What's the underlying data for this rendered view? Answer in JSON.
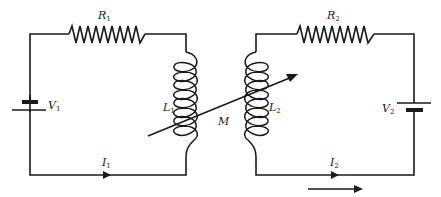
{
  "diagram": {
    "left_circuit": {
      "resistor": {
        "symbol": "R",
        "subscript": "1"
      },
      "inductor": {
        "symbol": "L",
        "subscript": "1"
      },
      "source": {
        "symbol": "V",
        "subscript": "1"
      },
      "current": {
        "symbol": "I",
        "subscript": "1"
      }
    },
    "right_circuit": {
      "resistor": {
        "symbol": "R",
        "subscript": "2"
      },
      "inductor": {
        "symbol": "L",
        "subscript": "2"
      },
      "source": {
        "symbol": "V",
        "subscript": "2"
      },
      "current": {
        "symbol": "I",
        "subscript": "2"
      }
    },
    "coupling": {
      "symbol": "M"
    },
    "colors": {
      "line": "#1a1a1a",
      "background": "#ffffff"
    }
  }
}
